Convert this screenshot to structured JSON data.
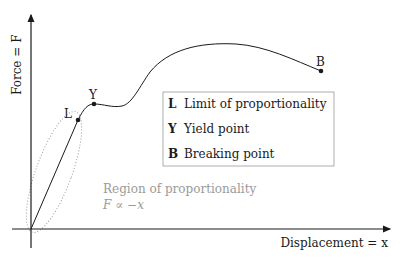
{
  "diagram": {
    "y_axis_label": "Force = F",
    "x_axis_label": "Displacement = x",
    "points": [
      {
        "key": "L",
        "name": "Limit of proportionality"
      },
      {
        "key": "Y",
        "name": "Yield point"
      },
      {
        "key": "B",
        "name": "Breaking point"
      }
    ],
    "legend": [
      {
        "key": "L",
        "label": "Limit of proportionality"
      },
      {
        "key": "Y",
        "label": "Yield point"
      },
      {
        "key": "B",
        "label": "Breaking point"
      }
    ],
    "region_label": "Region of proportionality",
    "region_formula": "F ∝ −x",
    "colors": {
      "ink": "#1a1a1a",
      "region": "#9a9a9a",
      "legend_border": "#9a9a9a"
    }
  }
}
